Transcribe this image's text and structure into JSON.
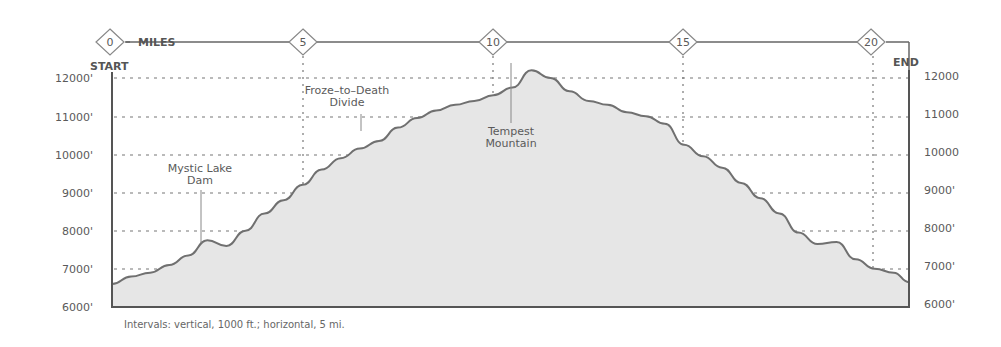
{
  "chart_data": {
    "type": "area",
    "title": "",
    "xlabel": "MILES",
    "ylabel": "Elevation (ft)",
    "x_ticks": [
      "0",
      "5",
      "10",
      "15",
      "20"
    ],
    "y_ticks_left": [
      "6000'",
      "7000'",
      "8000'",
      "9000'",
      "10000'",
      "11000'",
      "12000'"
    ],
    "y_ticks_right": [
      "6000'",
      "7000'",
      "8000'",
      "9000'",
      "10000",
      "11000",
      "12000"
    ],
    "xlim": [
      0,
      20.9
    ],
    "ylim": [
      6000,
      12000
    ],
    "grid": true,
    "start_label": "START",
    "end_label": "END",
    "x": [
      0,
      0.5,
      1,
      1.5,
      2,
      2.5,
      3,
      3.5,
      4,
      4.5,
      5,
      5.5,
      6,
      6.5,
      7,
      7.5,
      8,
      8.5,
      9,
      9.5,
      10,
      10.5,
      11,
      11.5,
      12,
      12.5,
      13,
      13.5,
      14,
      14.5,
      15,
      15.5,
      16,
      16.5,
      17,
      17.5,
      18,
      18.5,
      19,
      19.5,
      20,
      20.5,
      20.9
    ],
    "elevation": [
      6600,
      6800,
      6900,
      7100,
      7350,
      7750,
      7600,
      8000,
      8450,
      8800,
      9200,
      9600,
      9900,
      10150,
      10350,
      10700,
      10950,
      11150,
      11300,
      11400,
      11550,
      11750,
      12200,
      12000,
      11650,
      11400,
      11300,
      11100,
      11000,
      10800,
      10250,
      9950,
      9650,
      9250,
      8850,
      8450,
      7950,
      7650,
      7700,
      7250,
      7000,
      6900,
      6650
    ],
    "annotations": [
      {
        "text": [
          "Mystic Lake",
          "Dam"
        ],
        "x": 2.5,
        "elevation": 7600
      },
      {
        "text": [
          "Froze-to-Death",
          "Divide"
        ],
        "x": 6.5,
        "elevation": 10200
      },
      {
        "text": [
          "Tempest",
          "Mountain"
        ],
        "x": 10.6,
        "elevation": 12200
      }
    ],
    "caption": "Intervals: vertical, 1000 ft.; horizontal, 5 mi."
  },
  "labels": {
    "miles": "MILES",
    "start": "START",
    "end": "END",
    "mystic_1": "Mystic Lake",
    "mystic_2": "Dam",
    "froze_1": "Froze–to–Death",
    "froze_2": "Divide",
    "tempest_1": "Tempest",
    "tempest_2": "Mountain",
    "caption": "Intervals:  vertical, 1000 ft.; horizontal, 5 mi."
  },
  "colors": {
    "fill": "#e6e6e6",
    "line": "#707070",
    "frame": "#555555",
    "grid": "#777777"
  }
}
